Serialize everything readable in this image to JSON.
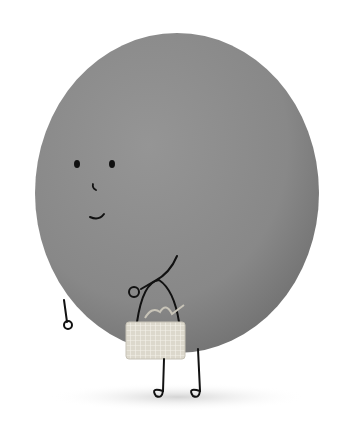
{
  "illustration": {
    "subject": "round gray character carrying a small basket",
    "colors": {
      "background": "#ffffff",
      "body": "#8a8a8a",
      "body_shadow": "#6f6f6f",
      "ink": "#111111",
      "basket": "#d8d4c8",
      "ground_shadow": "#d9d9d9"
    },
    "caption": ""
  }
}
